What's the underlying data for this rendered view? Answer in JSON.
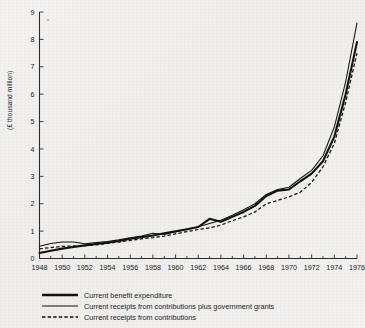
{
  "chart_data": {
    "type": "line",
    "title": "",
    "subtitle": "",
    "xlabel": "",
    "ylabel": "(£ thousand million)",
    "xlim": [
      1948,
      1976
    ],
    "ylim": [
      0,
      9
    ],
    "grid": false,
    "legend_position": "bottom-left",
    "xticks": [
      1948,
      1950,
      1952,
      1954,
      1956,
      1958,
      1960,
      1962,
      1964,
      1966,
      1968,
      1970,
      1972,
      1974,
      1976
    ],
    "xtick_labels": [
      "1948",
      "1950",
      "1952",
      "1954",
      "1956",
      "1958",
      "1960",
      "1962",
      "1964",
      "1966",
      "1968",
      "1970",
      "1972",
      "1974",
      "1976"
    ],
    "xminor_ticks": [
      1949,
      1951,
      1953,
      1955,
      1957,
      1959,
      1961,
      1963,
      1965,
      1967,
      1969,
      1971,
      1973,
      1975
    ],
    "yticks": [
      0,
      1,
      2,
      3,
      4,
      5,
      6,
      7,
      8,
      9
    ],
    "ytick_labels": [
      "0",
      "1",
      "2",
      "3",
      "4",
      "5",
      "6",
      "7",
      "8",
      "9"
    ],
    "x": [
      1948,
      1949,
      1950,
      1951,
      1952,
      1953,
      1954,
      1955,
      1956,
      1957,
      1958,
      1959,
      1960,
      1961,
      1962,
      1963,
      1964,
      1965,
      1966,
      1967,
      1968,
      1969,
      1970,
      1971,
      1972,
      1973,
      1974,
      1975,
      1976
    ],
    "series": [
      {
        "name": "Current benefit expenditure",
        "style": "thick-solid",
        "color": "#111111",
        "values": [
          0.2,
          0.28,
          0.36,
          0.42,
          0.48,
          0.53,
          0.58,
          0.64,
          0.72,
          0.78,
          0.84,
          0.92,
          0.99,
          1.07,
          1.15,
          1.45,
          1.34,
          1.52,
          1.7,
          1.92,
          2.28,
          2.48,
          2.52,
          2.82,
          3.1,
          3.55,
          4.45,
          6.0,
          7.9
        ]
      },
      {
        "name": "Current receipts from contributions plus government grants",
        "style": "thin-solid",
        "color": "#111111",
        "values": [
          0.45,
          0.55,
          0.6,
          0.6,
          0.54,
          0.58,
          0.62,
          0.68,
          0.76,
          0.82,
          0.92,
          0.88,
          0.98,
          1.06,
          1.16,
          1.28,
          1.4,
          1.58,
          1.78,
          2.0,
          2.34,
          2.52,
          2.6,
          2.92,
          3.22,
          3.75,
          4.8,
          6.45,
          8.6
        ]
      },
      {
        "name": "Current receipts from contributions",
        "style": "dashed",
        "color": "#111111",
        "values": [
          0.35,
          0.4,
          0.44,
          0.46,
          0.47,
          0.5,
          0.55,
          0.6,
          0.66,
          0.72,
          0.76,
          0.82,
          0.9,
          0.98,
          1.06,
          1.12,
          1.22,
          1.38,
          1.52,
          1.7,
          2.0,
          2.12,
          2.25,
          2.42,
          2.78,
          3.35,
          4.2,
          5.7,
          7.5
        ]
      }
    ],
    "legend": [
      {
        "label": "Current benefit expenditure",
        "style": "thick-solid"
      },
      {
        "label": "Current receipts from contributions plus government grants",
        "style": "thin-solid"
      },
      {
        "label": "Current receipts from contributions",
        "style": "dashed"
      }
    ]
  }
}
